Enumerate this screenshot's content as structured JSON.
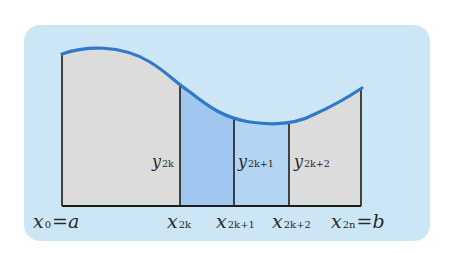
{
  "diagram": {
    "type": "simpson-rule-area-under-curve",
    "colors": {
      "panel": "#cde6f5",
      "gray_region": "#dcdcdc",
      "strip_dark": "#9fc7ef",
      "strip_light": "#b3d4f3",
      "curve": "#2f79c9",
      "lines": "#1c1c1c"
    },
    "panel": {
      "x": 24,
      "y": 25,
      "w": 406,
      "h": 216,
      "r": 16
    },
    "plot": {
      "baseline_y": 206,
      "x_left": 62,
      "x_right": 361,
      "curve_path": "M 62 54 C 85 46, 120 44, 150 62 C 168 73, 176 83, 190 92 C 210 108, 225 118, 250 122 C 270 125, 295 125, 315 114 C 335 105, 350 96, 362 88",
      "verticals": [
        {
          "x": 62,
          "top": 54
        },
        {
          "x": 180,
          "top": 86
        },
        {
          "x": 234,
          "top": 119
        },
        {
          "x": 289,
          "top": 122
        },
        {
          "x": 361,
          "top": 89
        }
      ],
      "strips": [
        {
          "x0": 180,
          "x1": 234,
          "tone": "dark"
        },
        {
          "x0": 234,
          "x1": 289,
          "tone": "light"
        }
      ]
    },
    "x_labels": [
      {
        "main": "x",
        "sub": "0",
        "suffix": "=a",
        "x": 33,
        "y": 228
      },
      {
        "main": "x",
        "sub": "2k",
        "suffix": "",
        "x": 167,
        "y": 228
      },
      {
        "main": "x",
        "sub": "2k+1",
        "suffix": "",
        "x": 216,
        "y": 228
      },
      {
        "main": "x",
        "sub": "2k+2",
        "suffix": "",
        "x": 272,
        "y": 228
      },
      {
        "main": "x",
        "sub": "2n",
        "suffix": "=b",
        "x": 331,
        "y": 228
      }
    ],
    "y_labels": [
      {
        "main": "y",
        "sub": "2k",
        "x": 152,
        "y": 167
      },
      {
        "main": "y",
        "sub": "2k+1",
        "x": 238,
        "y": 167
      },
      {
        "main": "y",
        "sub": "2k+2",
        "x": 294,
        "y": 167
      }
    ]
  }
}
